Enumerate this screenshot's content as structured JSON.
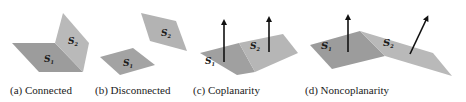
{
  "panels": [
    {
      "id": "a",
      "caption": "(a) Connected",
      "surfaces": [
        "S1",
        "S2"
      ]
    },
    {
      "id": "b",
      "caption": "(b) Disconnected",
      "surfaces": [
        "S1",
        "S2"
      ]
    },
    {
      "id": "c",
      "caption": "(c) Coplanarity",
      "surfaces": [
        "S1",
        "S2"
      ]
    },
    {
      "id": "d",
      "caption": "(d) Noncoplanarity",
      "surfaces": [
        "S1",
        "S2"
      ]
    }
  ],
  "labels": {
    "s": "S",
    "one": "1",
    "two": "2"
  },
  "colors": {
    "surface_dark": "#9c9c9c",
    "surface_light": "#b9b9b9",
    "arrow": "#111111"
  }
}
